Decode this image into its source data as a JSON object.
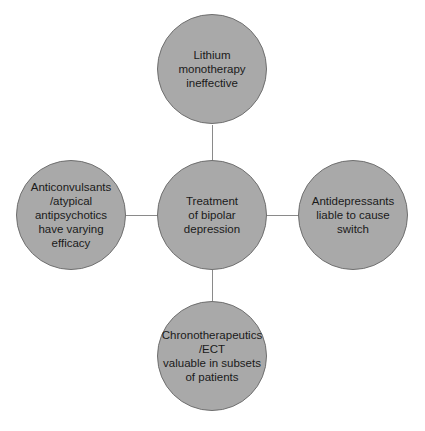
{
  "diagram": {
    "type": "hub-and-spoke",
    "center": {
      "label": "Treatment\nof bipolar\ndepression"
    },
    "spokes": [
      {
        "position": "top",
        "label": "Lithium monotherapy\nineffective"
      },
      {
        "position": "left",
        "label": "Anticonvulsants\n/atypical\nantipsychotics\nhave varying\nefficacy"
      },
      {
        "position": "right",
        "label": "Antidepressants\nliable to cause\nswitch"
      },
      {
        "position": "bottom",
        "label": "Chronotherapeutics\n/ECT\nvaluable in subsets\nof patients"
      }
    ],
    "colors": {
      "node_fill": "#a9a9a9",
      "node_border": "#6f6f6f",
      "connector": "#8a8a8a",
      "text": "#1a1a1a",
      "background": "#ffffff"
    }
  }
}
